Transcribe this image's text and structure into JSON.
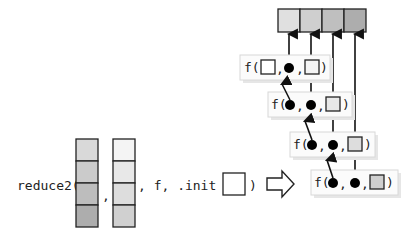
{
  "call": {
    "func_name_label": "reduce2(",
    "comma1_label": ",",
    "args_label": ", f, .init =",
    "close_paren_label": ")"
  },
  "vectors": {
    "x": {
      "cells": [
        "#d9d9d9",
        "#cbcbcb",
        "#bdbdbd",
        "#adadad"
      ]
    },
    "y": {
      "cells": [
        "#f4f4f4",
        "#e8e8e8",
        "#dddddd",
        "#d0d0d0"
      ]
    },
    "init": {
      "color": "#ffffff"
    }
  },
  "transform_arrow": {
    "icon": "hollow-right-arrow"
  },
  "output": {
    "cells": [
      "#e0e0e0",
      "#cfcfcf",
      "#bfbfbf",
      "#adadad"
    ]
  },
  "steps": [
    {
      "f_label": "f(",
      "first_arg": "init-square",
      "second_arg": "dot",
      "third_arg": "y1-square",
      "close": ")"
    },
    {
      "f_label": "f(",
      "first_arg": "dot",
      "second_arg": "dot",
      "third_arg": "y2-square",
      "close": ")"
    },
    {
      "f_label": "f(",
      "first_arg": "dot",
      "second_arg": "dot",
      "third_arg": "y3-square",
      "close": ")"
    },
    {
      "f_label": "f(",
      "first_arg": "dot",
      "second_arg": "dot",
      "third_arg": "y4-square",
      "close": ")"
    }
  ],
  "separators": {
    "comma": ","
  }
}
